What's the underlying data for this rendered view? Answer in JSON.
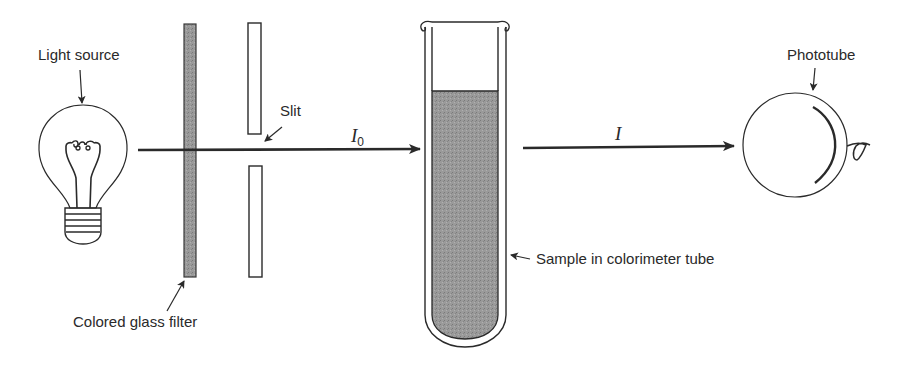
{
  "diagram": {
    "type": "colorimeter-schematic",
    "labels": {
      "light_source": "Light source",
      "filter": "Colored glass filter",
      "slit": "Slit",
      "incident_intensity": "I",
      "incident_subscript": "0",
      "transmitted_intensity": "I",
      "sample": "Sample in colorimeter tube",
      "phototube": "Phototube"
    },
    "colors": {
      "ink": "#2a2a2a",
      "shading": "#8f8f8f",
      "background": "#ffffff"
    },
    "components": [
      {
        "id": "light-source",
        "label": "Light source"
      },
      {
        "id": "colored-glass-filter",
        "label": "Colored glass filter"
      },
      {
        "id": "slit",
        "label": "Slit"
      },
      {
        "id": "colorimeter-tube",
        "label": "Sample in colorimeter tube"
      },
      {
        "id": "phototube",
        "label": "Phototube"
      }
    ],
    "beams": [
      {
        "from": "light-source",
        "to": "colorimeter-tube",
        "label": "I0"
      },
      {
        "from": "colorimeter-tube",
        "to": "phototube",
        "label": "I"
      }
    ]
  }
}
